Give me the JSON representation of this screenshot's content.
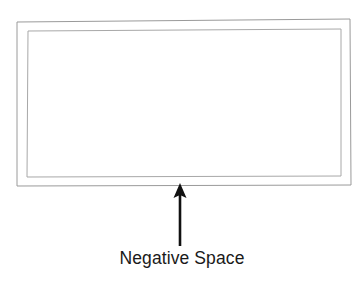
{
  "figure": {
    "type": "annotated-diagram",
    "background_color": "#ffffff",
    "title_visible": false
  },
  "frame": {
    "outer_rectangle": {
      "name": "outer-frame-rectangle",
      "stroke_color": "#9a9a9a",
      "stroke_width": 1,
      "fill": "none",
      "corners": {
        "top_left": [
          17,
          22
        ],
        "top_right": [
          350,
          19
        ],
        "bottom_right": [
          351,
          185
        ],
        "bottom_left": [
          17,
          186
        ]
      }
    },
    "inner_rectangle": {
      "name": "inner-frame-rectangle",
      "stroke_color": "#a8a8a8",
      "stroke_width": 1,
      "fill": "none",
      "corners": {
        "top_left": [
          28,
          31
        ],
        "top_right": [
          341,
          29
        ],
        "bottom_right": [
          341,
          176
        ],
        "bottom_left": [
          27,
          177
        ]
      }
    }
  },
  "annotation": {
    "arrow": {
      "name": "callout-arrow",
      "direction": "up",
      "color": "#111111",
      "shaft_width": 2.6,
      "tip": [
        180,
        183
      ],
      "tail": [
        180,
        246
      ],
      "head_width": 13,
      "head_height": 15
    },
    "label": {
      "text": "Negative Space",
      "color": "#1a1a1a",
      "font_size_px": 17.5,
      "align": "center",
      "position": [
        180,
        259
      ]
    }
  },
  "colors": {
    "background": "#ffffff",
    "frame_stroke": "#9a9a9a",
    "arrow": "#111111",
    "label": "#1a1a1a"
  }
}
